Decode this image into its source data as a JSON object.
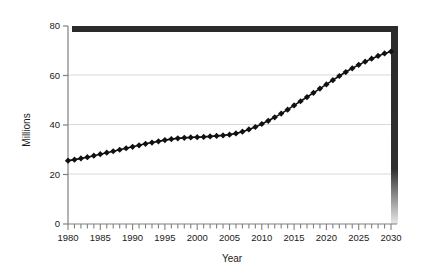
{
  "chart_data": {
    "type": "line",
    "title": "",
    "xlabel": "Year",
    "ylabel": "Millions",
    "xlim": [
      1980,
      2030
    ],
    "ylim": [
      0,
      80
    ],
    "ytick_values": [
      0,
      20,
      40,
      60,
      80
    ],
    "ytick_labels": [
      "0",
      "20",
      "40",
      "60",
      "80"
    ],
    "xtick_labels": [
      "1980",
      "1985",
      "1990",
      "1995",
      "2000",
      "2005",
      "2010",
      "2015",
      "2020",
      "2025",
      "2030"
    ],
    "xtick_label_values": [
      1980,
      1985,
      1990,
      1995,
      2000,
      2005,
      2010,
      2015,
      2020,
      2025,
      2030
    ],
    "minor_xticks_every": 1,
    "grid": "horizontal",
    "legend": "none",
    "marker": "diamond",
    "line_color": "#111111",
    "marker_color": "#111111",
    "grid_color": "#d9d9d9",
    "axis_color": "#808080",
    "frame_shadow_color": "#2b2b2b",
    "x": [
      1980,
      1981,
      1982,
      1983,
      1984,
      1985,
      1986,
      1987,
      1988,
      1989,
      1990,
      1991,
      1992,
      1993,
      1994,
      1995,
      1996,
      1997,
      1998,
      1999,
      2000,
      2001,
      2002,
      2003,
      2004,
      2005,
      2006,
      2007,
      2008,
      2009,
      2010,
      2011,
      2012,
      2013,
      2014,
      2015,
      2016,
      2017,
      2018,
      2019,
      2020,
      2021,
      2022,
      2023,
      2024,
      2025,
      2026,
      2027,
      2028,
      2029,
      2030
    ],
    "values": [
      25.6,
      26.0,
      26.5,
      27.0,
      27.6,
      28.2,
      28.8,
      29.4,
      30.0,
      30.6,
      31.2,
      31.8,
      32.4,
      32.9,
      33.4,
      33.9,
      34.3,
      34.6,
      34.8,
      35.0,
      35.1,
      35.2,
      35.4,
      35.6,
      35.8,
      36.1,
      36.6,
      37.3,
      38.2,
      39.2,
      40.4,
      41.7,
      43.1,
      44.6,
      46.2,
      47.9,
      49.6,
      51.3,
      53.0,
      54.7,
      56.4,
      58.1,
      59.8,
      61.4,
      62.9,
      64.3,
      65.6,
      66.8,
      67.9,
      68.9,
      69.7
    ]
  }
}
